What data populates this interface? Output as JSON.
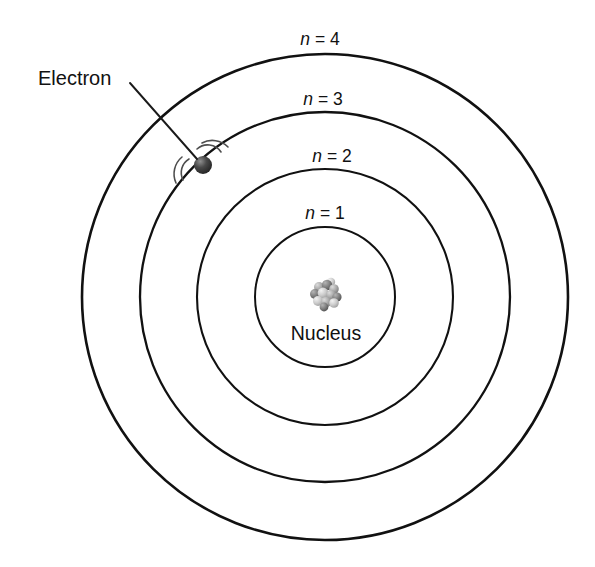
{
  "figure": {
    "background_color": "#ffffff",
    "line_color": "#111111"
  },
  "shells": [
    {
      "id": "shell-n1",
      "label": "n = 1",
      "var": "n",
      "equals_value": "= 1",
      "radius": 70,
      "label_x": 325,
      "label_y": 219
    },
    {
      "id": "shell-n2",
      "label": "n = 2",
      "var": "n",
      "equals_value": "= 2",
      "radius": 128,
      "label_x": 332,
      "label_y": 162
    },
    {
      "id": "shell-n3",
      "label": "n = 3",
      "var": "n",
      "equals_value": "= 3",
      "radius": 185,
      "label_x": 323,
      "label_y": 105
    },
    {
      "id": "shell-n4",
      "label": "n = 4",
      "var": "n",
      "equals_value": "= 4",
      "radius": 243,
      "label_x": 320,
      "label_y": 45
    }
  ],
  "center": {
    "x": 325,
    "y": 297
  },
  "electron": {
    "label": "Electron",
    "label_x": 38,
    "label_y": 85,
    "x": 203,
    "y": 165,
    "radius": 9,
    "color": "#3a3a3a",
    "highlight_color": "#8a8a8a",
    "leader_from_x": 130,
    "leader_from_y": 83,
    "leader_to_x": 197,
    "leader_to_y": 159,
    "motion_arc_color": "#4d4d4d"
  },
  "nucleus": {
    "label": "Nucleus",
    "label_x": 326,
    "label_y": 340,
    "x": 326,
    "y": 295,
    "cluster_radius": 13,
    "nucleon_color_light": "#cfcfcf",
    "nucleon_color_mid": "#9a9a9a",
    "nucleon_color_dark": "#5e5e5e",
    "nucleons": [
      {
        "x": -7,
        "y": -8,
        "r": 5.0,
        "shade": "mid"
      },
      {
        "x": 1,
        "y": -10,
        "r": 5.2,
        "shade": "dark"
      },
      {
        "x": 8,
        "y": -6,
        "r": 4.8,
        "shade": "mid"
      },
      {
        "x": -11,
        "y": -1,
        "r": 5.0,
        "shade": "dark"
      },
      {
        "x": -3,
        "y": -2,
        "r": 5.4,
        "shade": "light"
      },
      {
        "x": 5,
        "y": 0,
        "r": 5.0,
        "shade": "mid"
      },
      {
        "x": 11,
        "y": 2,
        "r": 4.6,
        "shade": "dark"
      },
      {
        "x": -8,
        "y": 6,
        "r": 5.0,
        "shade": "light"
      },
      {
        "x": 0,
        "y": 7,
        "r": 5.2,
        "shade": "mid"
      },
      {
        "x": 8,
        "y": 8,
        "r": 4.8,
        "shade": "light"
      },
      {
        "x": -2,
        "y": 12,
        "r": 4.4,
        "shade": "dark"
      },
      {
        "x": 5,
        "y": -13,
        "r": 4.2,
        "shade": "light"
      }
    ]
  }
}
